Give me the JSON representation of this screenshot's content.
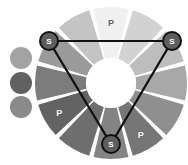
{
  "figure": {
    "background_color": "#ffffff",
    "canvas": {
      "width": 188,
      "height": 165
    }
  },
  "wheel": {
    "center": {
      "x": 111,
      "y": 83
    },
    "outer_radius": 76,
    "inner_radius": 25,
    "segment_count": 12,
    "gap_color": "#ffffff",
    "hub_color": "#ffffff",
    "segments": [
      {
        "index": 0,
        "position": "top",
        "angle_deg": 270,
        "fill": "#f0f0f0",
        "tone": "lightest",
        "label": "P",
        "label_on_light": true
      },
      {
        "index": 1,
        "position": "top-right",
        "angle_deg": 300,
        "fill": "#d2d2d2",
        "tone": "very-light",
        "label": "",
        "label_on_light": false
      },
      {
        "index": 2,
        "position": "upper-right",
        "angle_deg": 330,
        "fill": "#bdbdbd",
        "tone": "light",
        "label": "",
        "label_on_light": false
      },
      {
        "index": 3,
        "position": "right",
        "angle_deg": 0,
        "fill": "#a8a8a8",
        "tone": "mid-light",
        "label": "",
        "label_on_light": false
      },
      {
        "index": 4,
        "position": "lower-right",
        "angle_deg": 30,
        "fill": "#8f8f8f",
        "tone": "mid",
        "label": "",
        "label_on_light": false
      },
      {
        "index": 5,
        "position": "bottom-right",
        "angle_deg": 60,
        "fill": "#767676",
        "tone": "mid-dark",
        "label": "P",
        "label_on_light": false
      },
      {
        "index": 6,
        "position": "bottom",
        "angle_deg": 90,
        "fill": "#848484",
        "tone": "mid-dark",
        "label": "",
        "label_on_light": false
      },
      {
        "index": 7,
        "position": "bottom-left",
        "angle_deg": 120,
        "fill": "#6e6e6e",
        "tone": "dark",
        "label": "",
        "label_on_light": false
      },
      {
        "index": 8,
        "position": "lower-left",
        "angle_deg": 150,
        "fill": "#636363",
        "tone": "darkest",
        "label": "P",
        "label_on_light": false
      },
      {
        "index": 9,
        "position": "left",
        "angle_deg": 180,
        "fill": "#7c7c7c",
        "tone": "mid-dark",
        "label": "",
        "label_on_light": false
      },
      {
        "index": 10,
        "position": "upper-left",
        "angle_deg": 210,
        "fill": "#9a9a9a",
        "tone": "mid",
        "label": "",
        "label_on_light": false
      },
      {
        "index": 11,
        "position": "top-left",
        "angle_deg": 240,
        "fill": "#c4c4c4",
        "tone": "light",
        "label": "",
        "label_on_light": false
      }
    ]
  },
  "triangle": {
    "stroke_color": "#111111",
    "stroke_width": 2.2,
    "vertex_label": "S",
    "vertices": [
      {
        "id": "s-top-left",
        "label": "S",
        "x": 49,
        "y": 41,
        "radius": 9
      },
      {
        "id": "s-top-right",
        "label": "S",
        "x": 172,
        "y": 41,
        "radius": 9
      },
      {
        "id": "s-bottom",
        "label": "S",
        "x": 111,
        "y": 144,
        "radius": 9
      }
    ],
    "node_fill": "#5e5e5e",
    "node_stroke": "#111111"
  },
  "swatches": {
    "count": 3,
    "diameter": 22,
    "items": [
      {
        "id": "swatch-light",
        "fill": "#a3a3a3",
        "tone": "light",
        "x": 10,
        "y": 47
      },
      {
        "id": "swatch-dark",
        "fill": "#616161",
        "tone": "dark",
        "x": 10,
        "y": 72
      },
      {
        "id": "swatch-medium",
        "fill": "#8a8a8a",
        "tone": "medium",
        "x": 10,
        "y": 96
      }
    ]
  },
  "legend_keys": {
    "p": "P",
    "s": "S"
  }
}
